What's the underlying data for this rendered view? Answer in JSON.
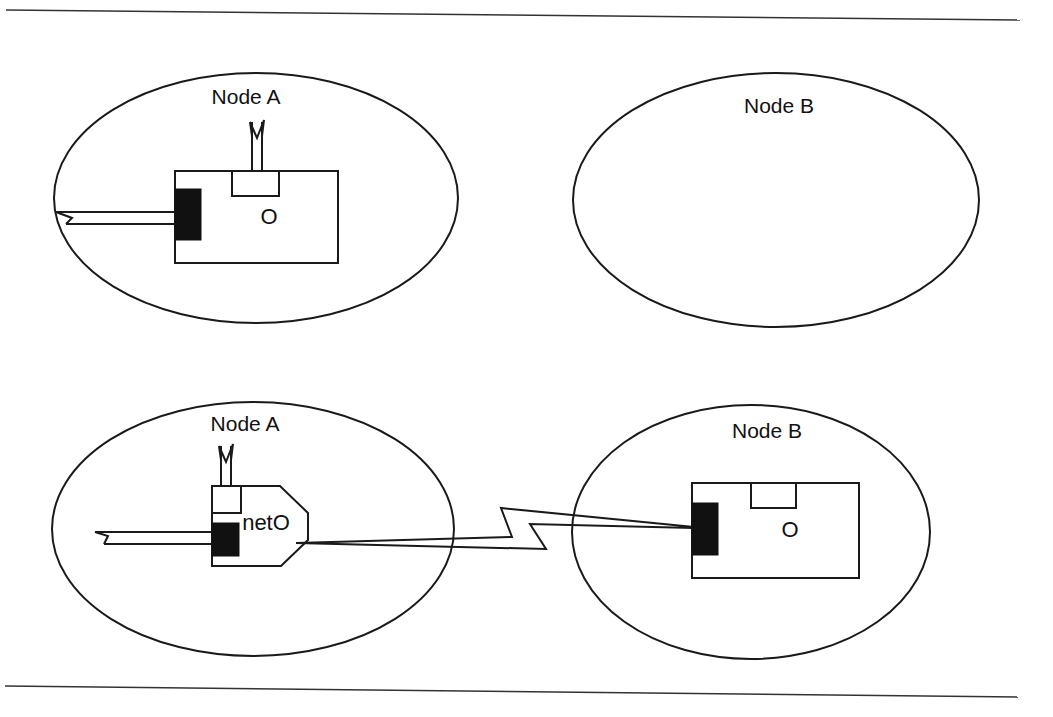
{
  "colors": {
    "ink": "#1a1a1a",
    "background": "#ffffff"
  },
  "panels": [
    {
      "name": "before",
      "nodes": [
        {
          "label": "Node A",
          "object_label": "O"
        },
        {
          "label": "Node B"
        }
      ]
    },
    {
      "name": "after",
      "nodes": [
        {
          "label": "Node A",
          "proxy_label": "netO"
        },
        {
          "label": "Node B",
          "object_label": "O"
        }
      ]
    }
  ]
}
